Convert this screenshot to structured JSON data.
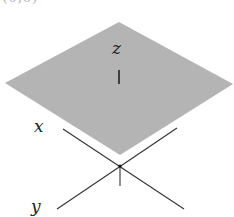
{
  "diagram": {
    "clipped_top_label": "(0,0)",
    "plane": {
      "fill": "#b4b4b4",
      "points": [
        [
          119,
          22
        ],
        [
          233,
          84
        ],
        [
          120,
          155
        ],
        [
          5,
          83
        ]
      ]
    },
    "axes": {
      "stroke": "#333333",
      "origin": [
        120,
        166
      ],
      "x": {
        "label": "x",
        "from": [
          63,
          129
        ],
        "to": [
          184,
          209
        ]
      },
      "y": {
        "label": "y",
        "from": [
          57,
          209
        ],
        "to": [
          177,
          128
        ]
      },
      "z": {
        "label": "z",
        "from": [
          120,
          166
        ],
        "to": [
          120,
          186
        ]
      }
    },
    "labels": {
      "x": "x",
      "y": "y",
      "z": "z"
    },
    "z_marker": {
      "from": [
        119,
        70
      ],
      "to": [
        119,
        84
      ]
    }
  }
}
